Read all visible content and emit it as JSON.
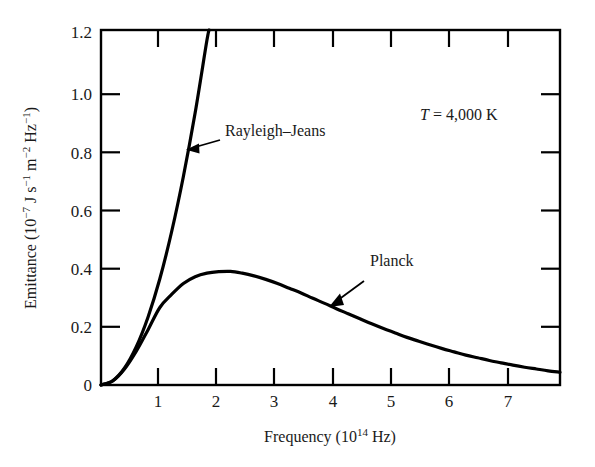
{
  "chart_data": {
    "type": "line",
    "title": "",
    "xlabel": "Frequency (10^14 Hz)",
    "xlabel_prefix": "Frequency (10",
    "xlabel_exponent": "14",
    "xlabel_suffix": " Hz)",
    "ylabel": "Emittance (10^-7 J s^-1 m^-2 Hz^-1)",
    "ylabel_parts": {
      "p1": "Emittance (10",
      "e1": "−7",
      "p2": " J s",
      "e2": "−1",
      "p3": " m",
      "e3": "−2",
      "p4": " Hz",
      "e4": "−1",
      "p5": ")"
    },
    "xlim": [
      0,
      7.8
    ],
    "ylim": [
      0,
      1.2
    ],
    "grid": false,
    "legend_position": "inline-annotations",
    "x_ticks": [
      1,
      2,
      3,
      4,
      5,
      6,
      7
    ],
    "x_tick_labels": [
      "1",
      "2",
      "3",
      "4",
      "5",
      "6",
      "7"
    ],
    "y_ticks": [
      0,
      0.2,
      0.4,
      0.6,
      0.8,
      1.0,
      1.2
    ],
    "y_tick_labels": [
      "0",
      "0.2",
      "0.4",
      "0.6",
      "0.8",
      "1.0",
      "1.2"
    ],
    "annotations": [
      {
        "name": "temperature-annotation",
        "text": "T = 4,000 K",
        "text_italic_part": "T",
        "text_rest": " = 4,000 K",
        "x": 4.55,
        "y": 0.92
      },
      {
        "name": "rayleigh-jeans-annotation",
        "text": "Rayleigh–Jeans",
        "x": 2.05,
        "y": 0.885,
        "arrow_from": [
          2.02,
          0.875
        ],
        "arrow_to": [
          1.62,
          0.845
        ]
      },
      {
        "name": "planck-annotation",
        "text": "Planck",
        "x": 4.5,
        "y": 0.395,
        "arrow_from": [
          4.45,
          0.36
        ],
        "arrow_to": [
          4.02,
          0.235
        ]
      }
    ],
    "series": [
      {
        "name": "Rayleigh–Jeans",
        "color": "#000000",
        "linewidth": 3.2,
        "x": [
          0,
          0.2,
          0.4,
          0.6,
          0.8,
          1.0,
          1.2,
          1.4,
          1.6,
          1.8,
          1.84
        ],
        "y": [
          0,
          0.0144,
          0.0575,
          0.1294,
          0.23,
          0.359,
          0.518,
          0.705,
          0.92,
          1.165,
          1.2
        ]
      },
      {
        "name": "Planck",
        "color": "#000000",
        "linewidth": 3.2,
        "x": [
          0,
          0.2,
          0.4,
          0.6,
          0.8,
          1.0,
          1.2,
          1.4,
          1.6,
          1.8,
          2.0,
          2.2,
          2.4,
          2.6,
          2.8,
          3.0,
          3.2,
          3.4,
          3.6,
          3.8,
          4.0,
          4.2,
          4.4,
          4.6,
          4.8,
          5.0,
          5.2,
          5.4,
          5.6,
          5.8,
          6.0,
          6.2,
          6.4,
          6.6,
          6.8,
          7.0,
          7.2,
          7.4,
          7.6,
          7.8
        ],
        "y": [
          0,
          0.014,
          0.054,
          0.114,
          0.187,
          0.262,
          0.306,
          0.343,
          0.366,
          0.378,
          0.383,
          0.384,
          0.378,
          0.369,
          0.357,
          0.343,
          0.327,
          0.311,
          0.293,
          0.276,
          0.258,
          0.241,
          0.224,
          0.207,
          0.191,
          0.176,
          0.161,
          0.148,
          0.135,
          0.123,
          0.112,
          0.101,
          0.092,
          0.083,
          0.075,
          0.067,
          0.06,
          0.054,
          0.048,
          0.043
        ]
      }
    ]
  },
  "axes": {
    "frame_color": "#000000",
    "background": "#ffffff",
    "tick_direction": "inward-and-outward"
  }
}
